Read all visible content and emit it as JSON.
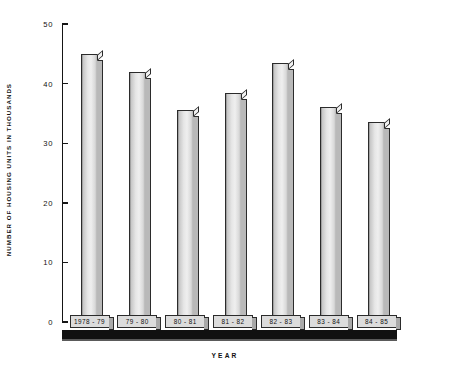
{
  "chart_data": {
    "type": "bar",
    "title": "",
    "xlabel": "YEAR",
    "ylabel": "NUMBER OF HOUSING UNITS IN THOUSANDS",
    "categories": [
      "1978 - 79",
      "79 - 80",
      "80 - 81",
      "81 - 82",
      "82 - 83",
      "83 - 84",
      "84 - 85"
    ],
    "values": [
      45,
      42,
      35.5,
      38.5,
      43.5,
      36,
      33.5
    ],
    "ylim": [
      0,
      50
    ],
    "yticks": [
      0,
      10,
      20,
      30,
      40,
      50
    ],
    "ytick_labels": [
      "0",
      "10",
      "20",
      "30",
      "40",
      "50"
    ],
    "grid": false,
    "legend": null,
    "style": "3d-shaded-vertical-bars"
  },
  "colors": {
    "axis": "#151515",
    "bar_face_light": "#efefef",
    "bar_face_dark": "#b4b4b4",
    "bar_side": "#b9b9b9",
    "plaque_fill": "#dcdcdc",
    "ground": "#111111",
    "background": "#ffffff"
  },
  "axes": {
    "y_title": "NUMBER OF HOUSING UNITS IN THOUSANDS",
    "x_title": "YEAR"
  }
}
